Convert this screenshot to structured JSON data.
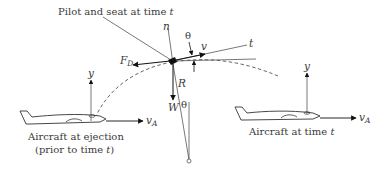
{
  "labels": {
    "pilot_callout": "Pilot and seat at time ",
    "pilot_callout_t": "t",
    "n_axis": "n",
    "t_axis": "t",
    "theta_top": "θ",
    "theta_bottom": "θ",
    "velocity": "v",
    "drag_force": "F",
    "drag_force_sub": "D",
    "reaction": "R",
    "weight": "W",
    "y_left": "y",
    "y_right": "y",
    "vA_left": "v",
    "vA_left_sub": "A",
    "vA_right": "v",
    "vA_right_sub": "A",
    "aircraft_ejection_line1": "Aircraft at ejection",
    "aircraft_ejection_line2": "(prior to time ",
    "aircraft_ejection_line2_t": "t",
    "aircraft_ejection_line2_end": ")",
    "aircraft_time_t": "Aircraft at time ",
    "aircraft_time_t_t": "t"
  },
  "colors": {
    "line": "#555555",
    "arrow": "#111111",
    "text": "#3a3a3a"
  }
}
